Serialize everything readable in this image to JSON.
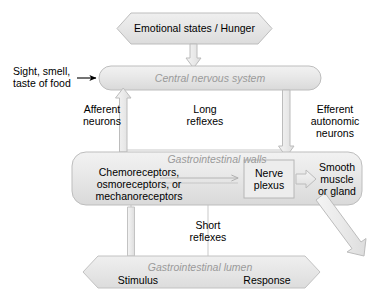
{
  "figure": {
    "type": "flow-diagram",
    "title_text": "Long and short reflexes of the gastrointestinal tract",
    "background": "#ffffff",
    "palette": {
      "shape_fill_light": "#e9e9e9",
      "shape_fill_mid": "#dedede",
      "shape_stroke": "#b4b4b4",
      "arrow_fill": "#ededed",
      "arrow_stroke": "#b0b0b0",
      "text_black": "#000000",
      "text_gray_italic": "#9a9a9a",
      "line_gray": "#b9b9b9"
    }
  },
  "nodes": {
    "emotional_states": {
      "label": "Emotional states / Hunger",
      "shape": "hexagon-banner",
      "fill": "#e9e9e9"
    },
    "cns": {
      "label": "Central nervous system",
      "shape": "rounded-rect",
      "style": "italic-gray",
      "fill": "#e2e2e2"
    },
    "gi_walls": {
      "label": "Gastrointestinal walls",
      "shape": "rounded-rect",
      "style": "italic-gray",
      "fill": "#e2e2e2"
    },
    "gi_lumen": {
      "label": "Gastrointestinal lumen",
      "shape": "hexagon-banner",
      "style": "italic-gray",
      "fill": "#e4e4e4"
    },
    "receptors": {
      "line1": "Chemoreceptors,",
      "line2": "osmoreceptors, or",
      "line3": "mechanoreceptors"
    },
    "nerve_plexus": {
      "line1": "Nerve",
      "line2": "plexus",
      "shape": "rect",
      "fill": "#ececec"
    },
    "effector": {
      "line1": "Smooth",
      "line2": "muscle",
      "line3": "or gland"
    },
    "stimulus": {
      "label": "Stimulus"
    },
    "response": {
      "label": "Response"
    }
  },
  "edge_labels": {
    "sensory_input": {
      "line1": "Sight, smell,",
      "line2": "taste of food"
    },
    "afferent": {
      "line1": "Afferent",
      "line2": "neurons"
    },
    "long_reflexes": {
      "line1": "Long",
      "line2": "reflexes"
    },
    "efferent": {
      "line1": "Efferent",
      "line2": "autonomic",
      "line3": "neurons"
    },
    "short_reflexes": {
      "line1": "Short",
      "line2": "reflexes"
    }
  },
  "connectors": [
    {
      "name": "emotional-to-cns",
      "kind": "block-arrow-down"
    },
    {
      "name": "sight-smell-to-cns",
      "kind": "thin-arrow-right"
    },
    {
      "name": "afferent-up-to-cns",
      "kind": "block-arrow-up"
    },
    {
      "name": "efferent-down-to-gi-walls",
      "kind": "block-arrow-down"
    },
    {
      "name": "long-reflex-loop",
      "kind": "plain-line"
    },
    {
      "name": "receptors-to-plexus",
      "kind": "thin-arrow-right"
    },
    {
      "name": "plexus-to-effector",
      "kind": "block-arrow-right"
    },
    {
      "name": "short-reflex-loop",
      "kind": "plain-line"
    },
    {
      "name": "lumen-stimulus-up",
      "kind": "plain-line"
    },
    {
      "name": "effector-to-lumen-response",
      "kind": "block-arrow-diagonal"
    }
  ]
}
